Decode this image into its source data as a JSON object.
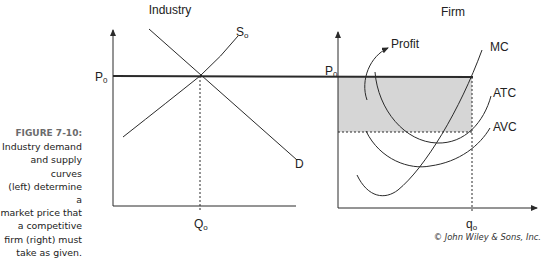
{
  "caption": {
    "figure_label": "FIGURE 7-10:",
    "text_lines": [
      "Industry demand",
      "and supply curves",
      "(left) determine a",
      "market price that",
      "a competitive",
      "firm (right) must",
      "take as given."
    ]
  },
  "industry": {
    "title": "Industry",
    "price_label": "P",
    "price_sub": "0",
    "quantity_label": "Q",
    "quantity_sub": "o",
    "supply_label": "S",
    "supply_sub": "o",
    "demand_label": "D"
  },
  "firm": {
    "title": "Firm",
    "price_label": "P",
    "price_sub": "0",
    "quantity_label": "q",
    "quantity_sub": "o",
    "profit_label": "Profit",
    "mc_label": "MC",
    "atc_label": "ATC",
    "avc_label": "AVC"
  },
  "colors": {
    "line": "#2a2a2a",
    "profit_fill": "#d6d6d6"
  },
  "copyright": "© John Wiley & Sons, Inc."
}
